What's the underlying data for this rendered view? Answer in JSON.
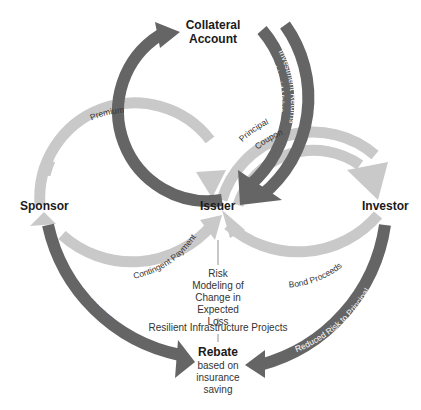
{
  "colors": {
    "light_arrow": "#c9c9c9",
    "dark_arrow": "#656565",
    "text": "#1a1a1a"
  },
  "nodes": {
    "collateral": "Collateral Account",
    "sponsor": "Sponsor",
    "issuer": "Issuer",
    "investor": "Investor",
    "rebate_title": "Rebate",
    "rebate_sub": "based on insurance saving"
  },
  "flows": {
    "premium": "Premium",
    "par_value": "Par Value",
    "liquid_value": "Liquid Value",
    "investment_returns": "Investment Returns",
    "principal": "Principal",
    "coupon": "Coupon",
    "contingent_payment": "Contingent Payment",
    "bond_proceeds": "Bond Proceeds",
    "reduced_premiums": "Reduced Premiums",
    "reduced_risk": "Reduced Risk to Principal"
  },
  "notes": {
    "risk_modeling": "Risk Modeling of Change in Expected Loss",
    "resilient": "Resilient Infrastructure Projects"
  }
}
